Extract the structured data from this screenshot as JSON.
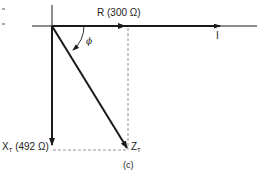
{
  "diagram": {
    "caption": "(c)",
    "colors": {
      "line": "#1a1a1a",
      "dashed": "#777777",
      "background": "#ffffff"
    },
    "vectors": {
      "resistance": {
        "symbol": "R",
        "value": "(300 Ω)"
      },
      "reactance": {
        "symbol": "X",
        "subscript": "T",
        "value": "(492 Ω)"
      },
      "impedance": {
        "symbol": "Z",
        "subscript": "T"
      },
      "current": {
        "symbol": "I"
      }
    },
    "angle": {
      "symbol": "ϕ"
    },
    "margin_marks": [
      "-",
      "-"
    ]
  }
}
